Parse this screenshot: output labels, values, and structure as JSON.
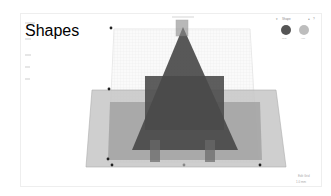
{
  "app": {
    "title": "Workplane"
  },
  "left_panel": {
    "items": [
      "Shapes",
      "Edit",
      "Group",
      "Align",
      "Mirror"
    ]
  },
  "shape_panel": {
    "title": "Shape",
    "solid_label": "Solid",
    "hole_label": "Hole",
    "solid_color": "#555555",
    "hole_color": "#b8b8b8"
  },
  "status": {
    "snap_label": "Snap Grid",
    "snap_value": "1.0 mm",
    "edit_grid": "Edit Grid"
  },
  "colors": {
    "dark_shape": "#4d4d4d",
    "mid_shape": "#8a8a8a",
    "light_shape": "#c4c4c4",
    "grid": "#e2e2e2"
  }
}
